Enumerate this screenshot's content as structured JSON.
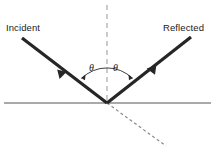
{
  "diagram": {
    "labels": {
      "incident": "Incident",
      "reflected": "Reflected",
      "angle_incidence": "θ",
      "angle_reflection": "θ"
    },
    "colors": {
      "ray": "#262626",
      "surface": "#8c8c8c",
      "normal_dashed": "#9a9a9a",
      "transmitted_dashed": "#8a8a8a",
      "arc": "#2b2b2b",
      "text": "#1a1a1a",
      "background": "#ffffff"
    },
    "geometry": {
      "vertex_x": 107,
      "vertex_y": 103,
      "incident_start_x": 22,
      "incident_start_y": 38,
      "reflected_end_x": 191,
      "reflected_end_y": 37,
      "normal_top_y": 5,
      "surface_left_x": 4,
      "surface_right_x": 211,
      "transmitted_end_x": 166,
      "transmitted_end_y": 145,
      "arc_radius": 36
    }
  }
}
